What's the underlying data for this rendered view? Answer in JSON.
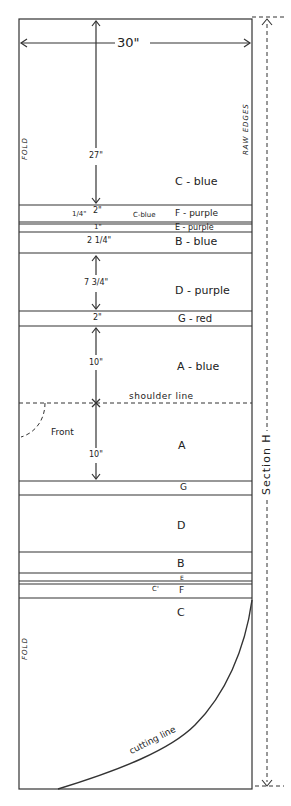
{
  "diagram": {
    "type": "quilt-layout",
    "width_label": "30\"",
    "fold_label": "FOLD",
    "raw_edges_label": "RAW EDGES",
    "section_label": "Section H",
    "shoulder_label": "shoulder line",
    "front_label": "Front",
    "cutting_label": "cutting line",
    "bands": [
      {
        "letter": "C - blue",
        "dimension": "27\""
      },
      {
        "letter": "F - purple",
        "dimension": "2\"",
        "side_note": "1/4\"",
        "extra_note": "C-blue"
      },
      {
        "letter": "E - purple",
        "dimension": "1\""
      },
      {
        "letter": "B - blue",
        "dimension": "2 1/4\""
      },
      {
        "letter": "D - purple",
        "dimension": "7 3/4\""
      },
      {
        "letter": "G - red",
        "dimension": "2\""
      },
      {
        "letter": "A - blue",
        "dimension": "10\""
      },
      {
        "letter": "A",
        "dimension": "10\""
      },
      {
        "letter": "G"
      },
      {
        "letter": "D"
      },
      {
        "letter": "B"
      },
      {
        "letter": "E"
      },
      {
        "letter": "F",
        "extra_note": "C'"
      },
      {
        "letter": "C"
      }
    ]
  }
}
